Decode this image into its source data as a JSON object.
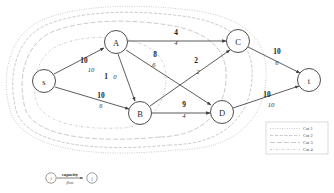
{
  "diagram": {
    "nodes": [
      {
        "id": "s",
        "label": "s",
        "cx": 44,
        "cy": 81,
        "r": 11.5
      },
      {
        "id": "A",
        "label": "A",
        "cx": 116,
        "cy": 42,
        "r": 11.5
      },
      {
        "id": "B",
        "label": "B",
        "cx": 140,
        "cy": 113,
        "r": 11.5
      },
      {
        "id": "C",
        "label": "C",
        "cx": 238,
        "cy": 41,
        "r": 11.5
      },
      {
        "id": "D",
        "label": "D",
        "cx": 222,
        "cy": 112,
        "r": 11.5
      },
      {
        "id": "t",
        "label": "t",
        "cx": 309,
        "cy": 80,
        "r": 11.5
      }
    ],
    "edges": [
      {
        "id": "s-A",
        "from": "s",
        "to": "A",
        "capacity": "10",
        "flow": "10",
        "cap_x": 84,
        "cap_y": 60,
        "flow_x": 91,
        "flow_y": 69
      },
      {
        "id": "s-B",
        "from": "s",
        "to": "B",
        "capacity": "10",
        "flow": "6",
        "cap_x": 101,
        "cap_y": 95,
        "flow_x": 101,
        "flow_y": 105
      },
      {
        "id": "A-B",
        "from": "A",
        "to": "B",
        "capacity": "1",
        "flow": "0",
        "cap_x": 106,
        "cap_y": 76,
        "flow_x": 115,
        "flow_y": 76
      },
      {
        "id": "A-C",
        "from": "A",
        "to": "C",
        "capacity": "4",
        "flow": "4",
        "cap_x": 176,
        "cap_y": 32,
        "flow_x": 176,
        "flow_y": 42
      },
      {
        "id": "A-D",
        "from": "A",
        "to": "D",
        "capacity": "8",
        "flow": "6",
        "cap_x": 155,
        "cap_y": 54,
        "flow_x": 154,
        "flow_y": 64
      },
      {
        "id": "B-C",
        "from": "B",
        "to": "C",
        "capacity": "2",
        "flow": "2",
        "cap_x": 196,
        "cap_y": 60,
        "flow_x": 198,
        "flow_y": 71
      },
      {
        "id": "B-D",
        "from": "B",
        "to": "D",
        "capacity": "9",
        "flow": "4",
        "cap_x": 184,
        "cap_y": 104,
        "flow_x": 184,
        "flow_y": 115
      },
      {
        "id": "C-t",
        "from": "C",
        "to": "t",
        "capacity": "10",
        "flow": "6",
        "cap_x": 277,
        "cap_y": 51,
        "flow_x": 277,
        "flow_y": 62
      },
      {
        "id": "D-t",
        "from": "D",
        "to": "t",
        "capacity": "10",
        "flow": "10",
        "cap_x": 267,
        "cap_y": 94,
        "flow_x": 271,
        "flow_y": 104
      }
    ]
  },
  "legend": {
    "items": [
      {
        "id": "cut1",
        "label": "Cut 1"
      },
      {
        "id": "cut2",
        "label": "Cut 2"
      },
      {
        "id": "cut3",
        "label": "Cut 3"
      },
      {
        "id": "cut4",
        "label": "Cut 4"
      }
    ]
  },
  "key": {
    "capacity_label": "capacity",
    "flow_label": "flow",
    "from_node": "i",
    "to_node": "j"
  },
  "colors": {
    "node_stroke": "#3a3a3a",
    "edge_stroke": "#3f3f3f",
    "cut_stroke": "#b9b9b9",
    "background": "#ffffff"
  }
}
